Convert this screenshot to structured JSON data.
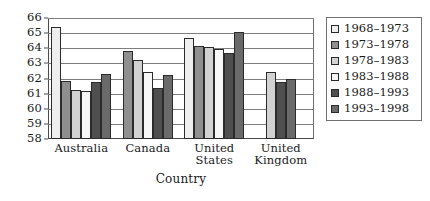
{
  "chart_data": {
    "type": "bar",
    "title": "",
    "xlabel": "Country",
    "ylabel": "",
    "ylim": [
      58,
      66
    ],
    "ytick_step": 1,
    "yticks": [
      58,
      59,
      60,
      61,
      62,
      63,
      64,
      65,
      66
    ],
    "grid": true,
    "legend_position": "right",
    "categories": [
      "Australia",
      "Canada",
      "United States",
      "United Kingdom"
    ],
    "series": [
      {
        "name": "1968–1973",
        "color": "#eeeeee",
        "values": [
          65.4,
          null,
          64.65,
          null
        ]
      },
      {
        "name": "1973–1978",
        "color": "#8f8f8f",
        "values": [
          61.85,
          63.8,
          64.15,
          null
        ]
      },
      {
        "name": "1978–1983",
        "color": "#d2d2d2",
        "values": [
          61.25,
          63.25,
          64.1,
          62.45
        ]
      },
      {
        "name": "1983–1988",
        "color": "#f7f7f7",
        "values": [
          61.15,
          62.4,
          63.95,
          null
        ]
      },
      {
        "name": "1988–1993",
        "color": "#4f4f4f",
        "values": [
          61.8,
          61.4,
          63.7,
          61.8
        ]
      },
      {
        "name": "1993–1998",
        "color": "#6a6a6a",
        "values": [
          62.3,
          62.2,
          65.1,
          62.0
        ]
      }
    ]
  },
  "axis": {
    "title": "Country",
    "ytick_labels": [
      "66",
      "65",
      "64",
      "63",
      "62",
      "61",
      "60",
      "59",
      "58"
    ]
  },
  "legend": {
    "entries": [
      {
        "label": "1968–1973"
      },
      {
        "label": "1973–1978"
      },
      {
        "label": "1978–1983"
      },
      {
        "label": "1983–1988"
      },
      {
        "label": "1988–1993"
      },
      {
        "label": "1993–1998"
      }
    ]
  }
}
